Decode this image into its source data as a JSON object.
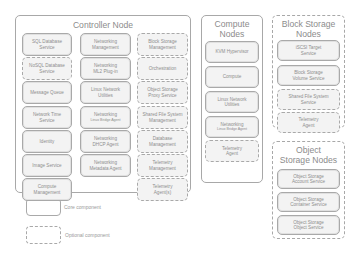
{
  "controller": {
    "title": "Controller Node",
    "col1": [
      {
        "l1": "SQL Database",
        "l2": "Service",
        "type": "core"
      },
      {
        "l1": "NoSQL Database",
        "l2": "Service",
        "type": "optional"
      },
      {
        "l1": "Message Queue",
        "l2": "",
        "type": "core"
      },
      {
        "l1": "Network Time",
        "l2": "Service",
        "type": "core"
      },
      {
        "l1": "Identity",
        "l2": "",
        "type": "core"
      },
      {
        "l1": "Image Service",
        "l2": "",
        "type": "core"
      },
      {
        "l1": "Compute",
        "l2": "Management",
        "type": "core"
      }
    ],
    "col2": [
      {
        "l1": "Networking",
        "l2": "Management",
        "type": "core"
      },
      {
        "l1": "Networking",
        "l2": "ML2 Plug-in",
        "type": "core"
      },
      {
        "l1": "Linux Network",
        "l2": "Utilities",
        "type": "core"
      },
      {
        "l1": "Networking",
        "l2": "Linux Bridge Agent",
        "type": "core",
        "small": true
      },
      {
        "l1": "Networking",
        "l2": "DHCP Agent",
        "type": "core"
      },
      {
        "l1": "Networking",
        "l2": "Metadata Agent",
        "type": "core"
      }
    ],
    "col3": [
      {
        "l1": "Block Storage",
        "l2": "Management",
        "type": "optional"
      },
      {
        "l1": "Orchestration",
        "l2": "",
        "type": "optional"
      },
      {
        "l1": "Object Storage",
        "l2": "Proxy Service",
        "type": "optional"
      },
      {
        "l1": "Shared File System",
        "l2": "Management",
        "type": "optional"
      },
      {
        "l1": "Database",
        "l2": "Management",
        "type": "optional"
      },
      {
        "l1": "Telemetry",
        "l2": "Management",
        "type": "optional"
      },
      {
        "l1": "Telemetry",
        "l2": "Agent(s)",
        "type": "optional"
      }
    ]
  },
  "compute": {
    "title_l1": "Compute",
    "title_l2": "Nodes",
    "items": [
      {
        "l1": "KVM Hypervisor",
        "l2": "",
        "type": "core"
      },
      {
        "l1": "Compute",
        "l2": "",
        "type": "core"
      },
      {
        "l1": "Linux Network",
        "l2": "Utilities",
        "type": "core"
      },
      {
        "l1": "Networking",
        "l2": "Linux Bridge Agent",
        "type": "core",
        "small": true
      },
      {
        "l1": "Telemetry",
        "l2": "Agent",
        "type": "optional"
      }
    ]
  },
  "block_storage": {
    "title_l1": "Block Storage",
    "title_l2": "Nodes",
    "items": [
      {
        "l1": "iSCSI Target",
        "l2": "Service",
        "type": "core"
      },
      {
        "l1": "Block Storage",
        "l2": "Volume Service",
        "type": "core"
      },
      {
        "l1": "Shared File System",
        "l2": "Service",
        "type": "optional"
      },
      {
        "l1": "Telemetry",
        "l2": "Agent",
        "type": "optional"
      }
    ]
  },
  "object_storage": {
    "title_l1": "Object",
    "title_l2": "Storage Nodes",
    "items": [
      {
        "l1": "Object Storage",
        "l2": "Account Service",
        "type": "core"
      },
      {
        "l1": "Object Storage",
        "l2": "Container Service",
        "type": "core"
      },
      {
        "l1": "Object Storage",
        "l2": "Object Service",
        "type": "core"
      }
    ]
  },
  "legend": {
    "core_label": "Core component",
    "optional_label": "Optional component"
  }
}
